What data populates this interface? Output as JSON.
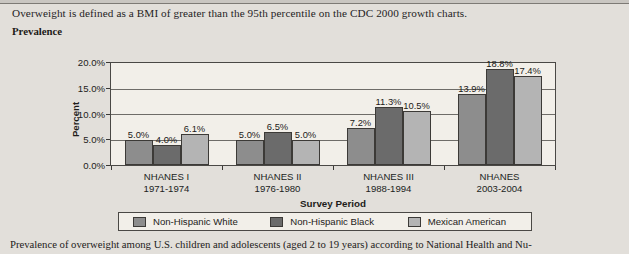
{
  "header": {
    "definition_text": "Overweight is defined as a BMI of greater than the 95th percentile on the CDC 2000 growth charts.",
    "section_label": "Prevalence"
  },
  "caption": "Prevalence of overweight among U.S. children and adolescents (aged 2 to 19 years) according to National Health and Nu-",
  "colors": {
    "series_white": "#8d8d8d",
    "series_black": "#6b6b6b",
    "series_mexican": "#b4b4b4",
    "plot_background": "#f2efe9",
    "axis": "#4a4845",
    "page_background": "#e2dfda"
  },
  "chart_data": {
    "type": "bar",
    "title": "",
    "xlabel": "Survey Period",
    "ylabel": "Percent",
    "ylim": [
      0,
      20
    ],
    "ytick_labels": [
      "0.0%",
      "5.0%",
      "10.0%",
      "15.0%",
      "20.0%"
    ],
    "ytick_values": [
      0,
      5,
      10,
      15,
      20
    ],
    "grid": true,
    "legend_position": "bottom",
    "categories": [
      {
        "name": "NHANES I",
        "years": "1971-1974"
      },
      {
        "name": "NHANES II",
        "years": "1976-1980"
      },
      {
        "name": "NHANES III",
        "years": "1988-1994"
      },
      {
        "name": "NHANES",
        "years": "2003-2004"
      }
    ],
    "series": [
      {
        "name": "Non-Hispanic White",
        "color": "#8d8d8d",
        "values": [
          5.0,
          5.0,
          7.2,
          13.9
        ],
        "labels": [
          "5.0%",
          "5.0%",
          "7.2%",
          "13.9%"
        ]
      },
      {
        "name": "Non-Hispanic Black",
        "color": "#6b6b6b",
        "values": [
          4.0,
          6.5,
          11.3,
          18.8
        ],
        "labels": [
          "4.0%",
          "6.5%",
          "11.3%",
          "18.8%"
        ]
      },
      {
        "name": "Mexican American",
        "color": "#b4b4b4",
        "values": [
          6.1,
          5.0,
          10.5,
          17.4
        ],
        "labels": [
          "6.1%",
          "5.0%",
          "10.5%",
          "17.4%"
        ]
      }
    ]
  }
}
